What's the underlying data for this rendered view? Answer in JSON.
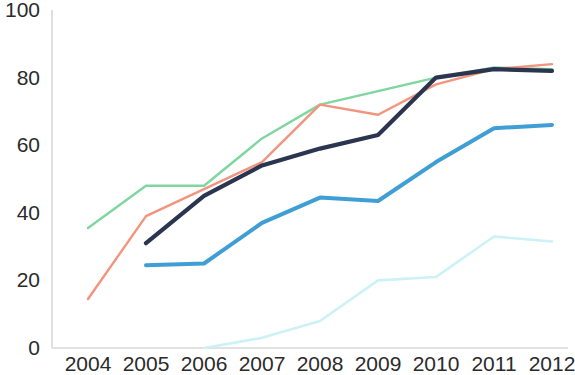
{
  "chart_data": {
    "type": "line",
    "title": "",
    "subtitle": "",
    "xlabel": "",
    "ylabel": "",
    "x": [
      2004,
      2005,
      2006,
      2007,
      2008,
      2009,
      2010,
      2011,
      2012
    ],
    "categories": [
      "2004",
      "2005",
      "2006",
      "2007",
      "2008",
      "2009",
      "2010",
      "2011",
      "2012"
    ],
    "xtick_labels": [
      "2004",
      "2005",
      "2006",
      "2007",
      "2008",
      "2009",
      "2010",
      "2011",
      "2012"
    ],
    "ytick_labels": [
      "0",
      "20",
      "40",
      "60",
      "80",
      "100"
    ],
    "yticks": [
      0,
      20,
      40,
      60,
      80,
      100
    ],
    "ylim": [
      0,
      100
    ],
    "xlim": [
      2004,
      2012
    ],
    "grid": false,
    "legend": "none",
    "series": [
      {
        "name": "series-green",
        "color": "#7fd6a0",
        "x": [
          2004,
          2005,
          2006,
          2007,
          2008,
          2009,
          2010,
          2011,
          2012
        ],
        "values": [
          35.5,
          48,
          48,
          62,
          72,
          76,
          80,
          83,
          82.5
        ]
      },
      {
        "name": "series-salmon",
        "color": "#f2947e",
        "x": [
          2004,
          2005,
          2006,
          2007,
          2008,
          2009,
          2010,
          2011,
          2012
        ],
        "values": [
          14.5,
          39,
          47,
          55,
          72,
          69,
          78,
          82.5,
          84
        ]
      },
      {
        "name": "series-navy",
        "color": "#2b3550",
        "x": [
          2005,
          2006,
          2007,
          2008,
          2009,
          2010,
          2011,
          2012
        ],
        "values": [
          31,
          45,
          54,
          59,
          63,
          80,
          82.5,
          82
        ]
      },
      {
        "name": "series-blue",
        "color": "#3f9fd4",
        "x": [
          2005,
          2006,
          2007,
          2008,
          2009,
          2010,
          2011,
          2012
        ],
        "values": [
          24.5,
          25,
          37,
          44.5,
          43.5,
          55,
          65,
          66
        ]
      },
      {
        "name": "series-cyan",
        "color": "#ccf2f7",
        "x": [
          2006,
          2007,
          2008,
          2009,
          2010,
          2011,
          2012
        ],
        "values": [
          0,
          3,
          8,
          20,
          21,
          33,
          31.5
        ]
      }
    ]
  },
  "axis": {
    "axis_color": "#d8d8d8"
  }
}
